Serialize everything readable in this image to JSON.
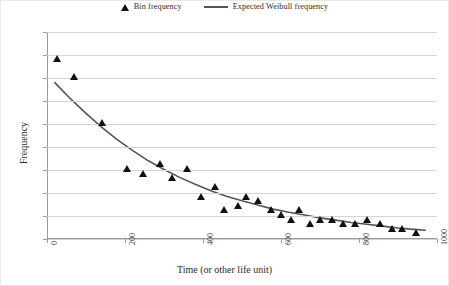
{
  "chart_data": {
    "type": "scatter",
    "title": "",
    "xlabel": "Time (or other life unit)",
    "ylabel": "Frequency",
    "xlim": [
      0,
      1000
    ],
    "ylim": [
      0,
      45
    ],
    "xticks": [
      0,
      200,
      400,
      600,
      800,
      1000
    ],
    "yticks": [
      0,
      5,
      10,
      15,
      20,
      25,
      30,
      35,
      40,
      45
    ],
    "grid": true,
    "legend_position": "top-center",
    "series": [
      {
        "name": "Bin frequency",
        "type": "scatter",
        "marker": "triangle",
        "color": "#111111",
        "points": [
          {
            "x": 25,
            "y": 39
          },
          {
            "x": 70,
            "y": 35
          },
          {
            "x": 140,
            "y": 25
          },
          {
            "x": 205,
            "y": 15
          },
          {
            "x": 245,
            "y": 14
          },
          {
            "x": 290,
            "y": 16
          },
          {
            "x": 320,
            "y": 13
          },
          {
            "x": 360,
            "y": 15
          },
          {
            "x": 395,
            "y": 9
          },
          {
            "x": 430,
            "y": 11
          },
          {
            "x": 455,
            "y": 6
          },
          {
            "x": 490,
            "y": 7
          },
          {
            "x": 510,
            "y": 9
          },
          {
            "x": 540,
            "y": 8
          },
          {
            "x": 575,
            "y": 6
          },
          {
            "x": 600,
            "y": 5
          },
          {
            "x": 625,
            "y": 4
          },
          {
            "x": 645,
            "y": 6
          },
          {
            "x": 675,
            "y": 3
          },
          {
            "x": 700,
            "y": 4
          },
          {
            "x": 730,
            "y": 4
          },
          {
            "x": 760,
            "y": 3
          },
          {
            "x": 790,
            "y": 3
          },
          {
            "x": 820,
            "y": 4
          },
          {
            "x": 855,
            "y": 3
          },
          {
            "x": 885,
            "y": 2
          },
          {
            "x": 910,
            "y": 2
          },
          {
            "x": 945,
            "y": 1
          }
        ]
      },
      {
        "name": "Expected Weibull frequency",
        "type": "line",
        "color": "#555555",
        "points": [
          {
            "x": 20,
            "y": 34.0
          },
          {
            "x": 60,
            "y": 30.5
          },
          {
            "x": 100,
            "y": 27.3
          },
          {
            "x": 140,
            "y": 24.3
          },
          {
            "x": 180,
            "y": 21.6
          },
          {
            "x": 220,
            "y": 19.2
          },
          {
            "x": 260,
            "y": 17.0
          },
          {
            "x": 300,
            "y": 15.1
          },
          {
            "x": 340,
            "y": 13.4
          },
          {
            "x": 380,
            "y": 11.9
          },
          {
            "x": 420,
            "y": 10.5
          },
          {
            "x": 460,
            "y": 9.3
          },
          {
            "x": 500,
            "y": 8.3
          },
          {
            "x": 540,
            "y": 7.4
          },
          {
            "x": 580,
            "y": 6.5
          },
          {
            "x": 620,
            "y": 5.8
          },
          {
            "x": 660,
            "y": 5.2
          },
          {
            "x": 700,
            "y": 4.6
          },
          {
            "x": 740,
            "y": 4.1
          },
          {
            "x": 780,
            "y": 3.6
          },
          {
            "x": 820,
            "y": 3.2
          },
          {
            "x": 860,
            "y": 2.8
          },
          {
            "x": 900,
            "y": 2.4
          },
          {
            "x": 940,
            "y": 2.1
          },
          {
            "x": 970,
            "y": 1.9
          }
        ]
      }
    ]
  },
  "legend": {
    "bin_label": "Bin frequency",
    "weibull_label": "Expected Weibull frequency"
  },
  "axes": {
    "x_title": "Time (or other life unit)",
    "y_title": "Frequency"
  }
}
